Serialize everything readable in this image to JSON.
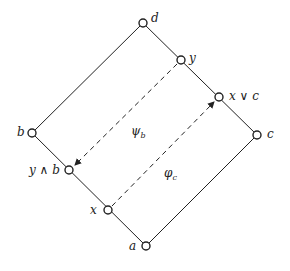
{
  "diagram": {
    "type": "lattice-diagram",
    "nodes": [
      {
        "id": "d",
        "label": "d",
        "x": 143,
        "y": 23
      },
      {
        "id": "y",
        "label": "y",
        "x": 181,
        "y": 60
      },
      {
        "id": "xvc",
        "label": "x ∨ c",
        "x": 219,
        "y": 96
      },
      {
        "id": "c",
        "label": "c",
        "x": 257,
        "y": 135
      },
      {
        "id": "b",
        "label": "b",
        "x": 32,
        "y": 133
      },
      {
        "id": "ywb",
        "label": "y ∧ b",
        "x": 69,
        "y": 170
      },
      {
        "id": "x",
        "label": "x",
        "x": 108,
        "y": 210
      },
      {
        "id": "a",
        "label": "a",
        "x": 146,
        "y": 246
      }
    ],
    "edges": [
      {
        "from": "d",
        "to": "y",
        "style": "solid"
      },
      {
        "from": "y",
        "to": "xvc",
        "style": "solid"
      },
      {
        "from": "xvc",
        "to": "c",
        "style": "solid"
      },
      {
        "from": "d",
        "to": "b",
        "style": "solid"
      },
      {
        "from": "b",
        "to": "ywb",
        "style": "solid"
      },
      {
        "from": "ywb",
        "to": "x",
        "style": "solid"
      },
      {
        "from": "x",
        "to": "a",
        "style": "solid"
      },
      {
        "from": "a",
        "to": "c",
        "style": "solid"
      }
    ],
    "maps": [
      {
        "id": "psi_b",
        "label": "ψ_b",
        "from": "y",
        "to": "ywb",
        "style": "dashed-arrow"
      },
      {
        "id": "phi_c",
        "label": "φ_c",
        "from": "x",
        "to": "xvc",
        "style": "dashed-arrow"
      }
    ],
    "map_labels": {
      "psi_b": {
        "main": "ψ",
        "sub": "b"
      },
      "phi_c": {
        "main": "φ",
        "sub": "c"
      }
    },
    "colors": {
      "line": "#222222",
      "node_fill": "#ffffff"
    }
  }
}
